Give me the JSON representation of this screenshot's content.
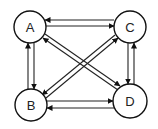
{
  "diagram": {
    "type": "directed-graph",
    "nodes": [
      {
        "id": "A",
        "label": "A",
        "cx": 30,
        "cy": 27,
        "r": 16
      },
      {
        "id": "C",
        "label": "C",
        "cx": 130,
        "cy": 27,
        "r": 16
      },
      {
        "id": "B",
        "label": "B",
        "cx": 31,
        "cy": 105,
        "r": 16
      },
      {
        "id": "D",
        "label": "D",
        "cx": 130,
        "cy": 101,
        "r": 17
      }
    ],
    "edges": [
      {
        "from": "C",
        "to": "A"
      },
      {
        "from": "A",
        "to": "C"
      },
      {
        "from": "B",
        "to": "D"
      },
      {
        "from": "D",
        "to": "B"
      },
      {
        "from": "B",
        "to": "A"
      },
      {
        "from": "A",
        "to": "B"
      },
      {
        "from": "C",
        "to": "D"
      },
      {
        "from": "D",
        "to": "C"
      },
      {
        "from": "D",
        "to": "A"
      },
      {
        "from": "A",
        "to": "D"
      },
      {
        "from": "B",
        "to": "C"
      },
      {
        "from": "C",
        "to": "B"
      }
    ],
    "colors": {
      "stroke": "#111111",
      "background": "#ffffff"
    }
  }
}
